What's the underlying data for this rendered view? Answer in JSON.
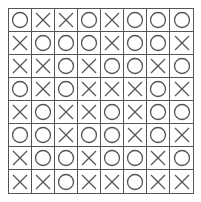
{
  "board": {
    "rows": 8,
    "cols": 8,
    "line_color": "#555555",
    "mark_color": "#555555",
    "cells": [
      [
        "O",
        "X",
        "X",
        "O",
        "X",
        "O",
        "O",
        "O"
      ],
      [
        "X",
        "O",
        "O",
        "O",
        "X",
        "O",
        "O",
        "X"
      ],
      [
        "X",
        "X",
        "O",
        "X",
        "O",
        "O",
        "X",
        "O"
      ],
      [
        "O",
        "X",
        "O",
        "X",
        "X",
        "X",
        "O",
        "X"
      ],
      [
        "X",
        "O",
        "X",
        "X",
        "O",
        "X",
        "O",
        "O"
      ],
      [
        "O",
        "O",
        "X",
        "O",
        "O",
        "X",
        "O",
        "X"
      ],
      [
        "X",
        "O",
        "O",
        "X",
        "O",
        "O",
        "X",
        "O"
      ],
      [
        "X",
        "X",
        "O",
        "X",
        "X",
        "O",
        "X",
        "X"
      ]
    ]
  }
}
